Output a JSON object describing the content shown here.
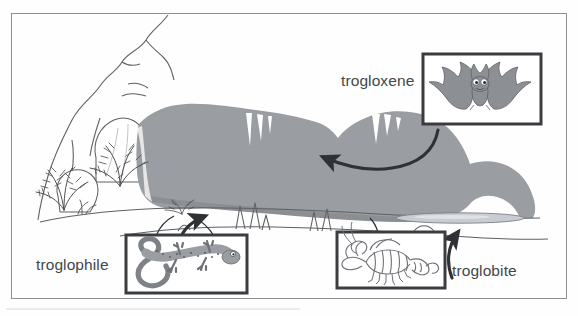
{
  "figure": {
    "frame_color": "#8d9095",
    "background_color": "#fefefe"
  },
  "labels": {
    "trogloxene": "trogloxene",
    "troglophile": "troglophile",
    "troglobite": "troglobite"
  },
  "boxes": [
    {
      "id": "trogloxene-box",
      "label": "trogloxene",
      "creature": "bat",
      "creature_icon": "bat-icon",
      "border_color": "#3a3c3f",
      "fill_color": "#ffffff",
      "creature_color": "#8c8f93",
      "x": 423,
      "y": 54,
      "w": 118,
      "h": 70
    },
    {
      "id": "troglophile-box",
      "label": "troglophile",
      "creature": "salamander",
      "creature_icon": "salamander-icon",
      "border_color": "#3a3c3f",
      "fill_color": "#ffffff",
      "creature_color": "#9a9da1",
      "x": 126,
      "y": 235,
      "w": 121,
      "h": 58
    },
    {
      "id": "troglobite-box",
      "label": "troglobite",
      "creature": "cave crayfish",
      "creature_icon": "crayfish-icon",
      "border_color": "#3a3c3f",
      "fill_color": "#ffffff",
      "creature_color": "#6e7175",
      "x": 337,
      "y": 232,
      "w": 108,
      "h": 56
    }
  ],
  "arrows": [
    {
      "id": "trogloxene-arrow",
      "from": "trogloxene-box",
      "to": "cave-entrance-ceiling",
      "color": "#2f3134",
      "direction": "leftward-curve"
    },
    {
      "id": "troglophile-arrow",
      "from": "troglophile-box",
      "to": "cave-twilight-floor",
      "color": "#2f3134",
      "direction": "up-rightward-curve"
    },
    {
      "id": "troglobite-arrow",
      "from": "troglobite-box",
      "to": "cave-deep-pool",
      "color": "#2f3134",
      "direction": "upward-curve"
    }
  ],
  "scene_elements": [
    {
      "name": "cave-ceiling-shading",
      "color": "#9a9da1"
    },
    {
      "name": "cave-wall-outline",
      "color": "#6b6e72"
    },
    {
      "name": "stalactite",
      "color": "#ffffff"
    },
    {
      "name": "stalagmite",
      "color": "#ffffff"
    },
    {
      "name": "cave-pool",
      "color": "#c9ccd0"
    },
    {
      "name": "fern-plant",
      "color": "#4e5154"
    },
    {
      "name": "boulder",
      "color": "#ffffff"
    },
    {
      "name": "hillside-surface",
      "color": "#ffffff"
    }
  ]
}
